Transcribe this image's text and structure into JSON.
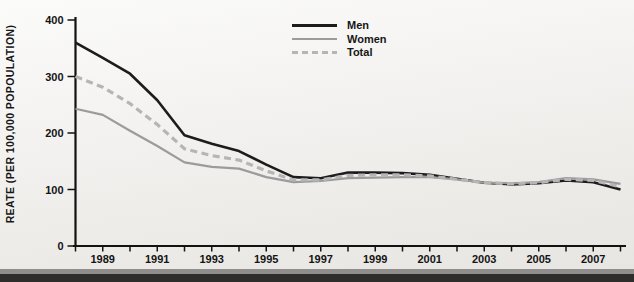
{
  "chart_data": {
    "type": "line",
    "title": "",
    "xlabel": "",
    "ylabel": "REATE (PER 100,000 POPOULATION)",
    "x": [
      1988,
      1989,
      1990,
      1991,
      1992,
      1993,
      1994,
      1995,
      1996,
      1997,
      1998,
      1999,
      2000,
      2001,
      2002,
      2003,
      2004,
      2005,
      2006,
      2007,
      2008
    ],
    "x_tick_labels": [
      "1989",
      "1991",
      "1993",
      "1995",
      "1997",
      "1999",
      "2001",
      "2003",
      "2005",
      "2007"
    ],
    "y_ticks": [
      0,
      100,
      200,
      300,
      400
    ],
    "ylim": [
      0,
      400
    ],
    "grid": false,
    "legend_position": "top-center",
    "series": [
      {
        "name": "Men",
        "color": "#1c1c1c",
        "style": "solid",
        "width": 2.6,
        "values": [
          360,
          333,
          305,
          258,
          196,
          181,
          168,
          144,
          122,
          120,
          130,
          130,
          129,
          126,
          119,
          112,
          109,
          111,
          116,
          113,
          100
        ]
      },
      {
        "name": "Women",
        "color": "#9b9b9b",
        "style": "solid",
        "width": 2.2,
        "values": [
          243,
          232,
          204,
          177,
          148,
          140,
          137,
          122,
          113,
          115,
          120,
          121,
          122,
          122,
          118,
          112,
          111,
          113,
          120,
          118,
          110
        ]
      },
      {
        "name": "Total",
        "color": "#b5b5b5",
        "style": "dashed",
        "width": 3.2,
        "values": [
          300,
          281,
          252,
          215,
          172,
          160,
          152,
          133,
          117,
          117,
          125,
          126,
          126,
          124,
          118,
          112,
          110,
          112,
          118,
          116,
          105
        ]
      }
    ]
  },
  "colors": {
    "axis": "#121212",
    "tick_label": "#141414",
    "bottom_bar_gray": "#8f8e8c",
    "bottom_bar_dark": "#2e2d2c"
  }
}
